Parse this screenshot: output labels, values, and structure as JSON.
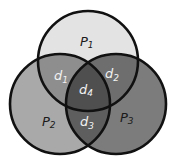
{
  "diagram": {
    "type": "venn-3-set",
    "sets": [
      {
        "id": "p1",
        "label": "P1",
        "sub": "1",
        "base": "P",
        "fill": "#e3e3e3"
      },
      {
        "id": "p2",
        "label": "P2",
        "sub": "2",
        "base": "P",
        "fill": "#a9a9a9"
      },
      {
        "id": "p3",
        "label": "P3",
        "sub": "3",
        "base": "P",
        "fill": "#7c7c7c"
      }
    ],
    "intersections": [
      {
        "id": "d1",
        "label": "d1",
        "base": "d",
        "sub": "1",
        "between": [
          "P1",
          "P2"
        ],
        "fill": "#8e8e8e"
      },
      {
        "id": "d2",
        "label": "d2",
        "base": "d",
        "sub": "2",
        "between": [
          "P1",
          "P3"
        ],
        "fill": "#6e6e6e"
      },
      {
        "id": "d3",
        "label": "d3",
        "base": "d",
        "sub": "3",
        "between": [
          "P2",
          "P3"
        ],
        "fill": "#5e5e5e"
      },
      {
        "id": "d4",
        "label": "d4",
        "base": "d",
        "sub": "4",
        "between": [
          "P1",
          "P2",
          "P3"
        ],
        "fill": "#4f4f4f"
      }
    ],
    "outline_color": "#111111"
  }
}
